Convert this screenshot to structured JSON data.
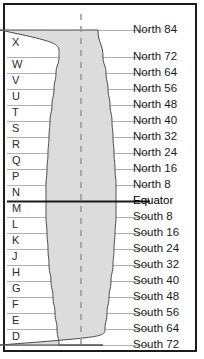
{
  "diagram": {
    "colors": {
      "frame_border": "#1c1c1c",
      "background": "#ffffff",
      "zone_fill": "#dcdcdc",
      "zone_outline": "#4a4a4a",
      "gridline": "#a8a8a8",
      "equator_line": "#1a1a1a",
      "center_dash": "#9a9a9a",
      "label_text": "#1a1a1a"
    },
    "center_meridian": {
      "name": "central-meridian-dashed-line",
      "style": "dashed"
    },
    "latitude_labels": [
      {
        "text": "North 84",
        "y": 30,
        "equator": false
      },
      {
        "text": "North 72",
        "y": 57,
        "equator": false
      },
      {
        "text": "North 64",
        "y": 73,
        "equator": false
      },
      {
        "text": "North 56",
        "y": 89,
        "equator": false
      },
      {
        "text": "North 48",
        "y": 105,
        "equator": false
      },
      {
        "text": "North 40",
        "y": 121,
        "equator": false
      },
      {
        "text": "North 32",
        "y": 137,
        "equator": false
      },
      {
        "text": "North 24",
        "y": 153,
        "equator": false
      },
      {
        "text": "North 16",
        "y": 169,
        "equator": false
      },
      {
        "text": "North 8",
        "y": 185,
        "equator": false
      },
      {
        "text": "Equator",
        "y": 201,
        "equator": true
      },
      {
        "text": "South 8",
        "y": 217,
        "equator": false
      },
      {
        "text": "South 16",
        "y": 233,
        "equator": false
      },
      {
        "text": "South 24",
        "y": 249,
        "equator": false
      },
      {
        "text": "South 32",
        "y": 265,
        "equator": false
      },
      {
        "text": "South 40",
        "y": 281,
        "equator": false
      },
      {
        "text": "South 48",
        "y": 297,
        "equator": false
      },
      {
        "text": "South 56",
        "y": 313,
        "equator": false
      },
      {
        "text": "South 64",
        "y": 329,
        "equator": false
      },
      {
        "text": "South 72",
        "y": 345,
        "equator": false
      },
      {
        "text": "South 80",
        "y": 361,
        "equator": false
      }
    ],
    "band_letters": [
      {
        "letter": "X",
        "y": 43
      },
      {
        "letter": "W",
        "y": 65
      },
      {
        "letter": "V",
        "y": 81
      },
      {
        "letter": "U",
        "y": 97
      },
      {
        "letter": "T",
        "y": 113
      },
      {
        "letter": "S",
        "y": 129
      },
      {
        "letter": "R",
        "y": 145
      },
      {
        "letter": "Q",
        "y": 161
      },
      {
        "letter": "P",
        "y": 177
      },
      {
        "letter": "N",
        "y": 193
      },
      {
        "letter": "M",
        "y": 209
      },
      {
        "letter": "L",
        "y": 225
      },
      {
        "letter": "K",
        "y": 241
      },
      {
        "letter": "J",
        "y": 257
      },
      {
        "letter": "H",
        "y": 273
      },
      {
        "letter": "G",
        "y": 289
      },
      {
        "letter": "F",
        "y": 305
      },
      {
        "letter": "E",
        "y": 321
      },
      {
        "letter": "D",
        "y": 337
      }
    ]
  },
  "chart_data": {
    "type": "diagram",
    "xlabel": "",
    "ylabel": "Latitude",
    "ylim": [
      -80,
      84
    ],
    "grid": true,
    "legend": "none",
    "categories": [
      "North 84",
      "North 72",
      "North 64",
      "North 56",
      "North 48",
      "North 40",
      "North 32",
      "North 24",
      "North 16",
      "North 8",
      "Equator",
      "South 8",
      "South 16",
      "South 24",
      "South 32",
      "South 40",
      "South 48",
      "South 56",
      "South 64",
      "South 72",
      "South 80"
    ],
    "values": [
      84,
      72,
      64,
      56,
      48,
      40,
      32,
      24,
      16,
      8,
      0,
      -8,
      -16,
      -24,
      -32,
      -40,
      -48,
      -56,
      -64,
      -72,
      -80
    ],
    "band_letters": [
      "X",
      "W",
      "V",
      "U",
      "T",
      "S",
      "R",
      "Q",
      "P",
      "N",
      "M",
      "L",
      "K",
      "J",
      "H",
      "G",
      "F",
      "E",
      "D"
    ],
    "zone_half_width_px": [
      17,
      22,
      25,
      27,
      29,
      31,
      32,
      33,
      34,
      35,
      35,
      35,
      34,
      33,
      32,
      30,
      28,
      26,
      24,
      22,
      21
    ]
  }
}
